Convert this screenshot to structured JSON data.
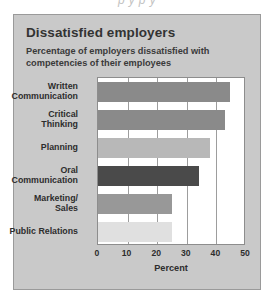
{
  "page": {
    "clipped_caption_above": "p  y             p  y"
  },
  "card": {
    "title": "Dissatisfied employers",
    "subtitle": "Percentage of employers dissatisfied with competencies of their employees",
    "background_color": "#c9c9c9",
    "border_color": "#9a9a9a"
  },
  "chart_data": {
    "type": "bar",
    "orientation": "horizontal",
    "title": "Dissatisfied employers",
    "subtitle": "Percentage of employers dissatisfied with competencies of their employees",
    "xlabel": "Percent",
    "ylabel": "",
    "xlim": [
      0,
      50
    ],
    "xticks": [
      0,
      10,
      20,
      30,
      40,
      50
    ],
    "xtick_labels": [
      "0",
      "10",
      "20",
      "30",
      "40",
      "50"
    ],
    "grid": "vertical",
    "legend": "none",
    "plot_background": "#ffffff",
    "categories": [
      "Written Communication",
      "Critical Thinking",
      "Planning",
      "Oral Communication",
      "Marketing/ Sales",
      "Public Relations"
    ],
    "category_label_lines": [
      [
        "Written",
        "Communication"
      ],
      [
        "Critical",
        "Thinking"
      ],
      [
        "Planning"
      ],
      [
        "Oral",
        "Communication"
      ],
      [
        "Marketing/",
        "Sales"
      ],
      [
        "Public Relations"
      ]
    ],
    "values": [
      44.5,
      43,
      38,
      34,
      25,
      25
    ],
    "bar_colors": [
      "#8a8a8a",
      "#8a8a8a",
      "#b8b8b8",
      "#4a4a4a",
      "#989898",
      "#e0e0e0"
    ]
  }
}
